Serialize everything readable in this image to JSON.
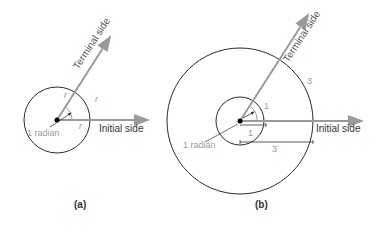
{
  "figure_a": {
    "caption": "(a)",
    "terminal_label": "Terminal side",
    "initial_label": "Initial side",
    "angle_label": "1 radian",
    "radius_labels": [
      "r",
      "r",
      "r"
    ]
  },
  "figure_b": {
    "caption": "(b)",
    "terminal_label": "Terminal side",
    "initial_label": "Initial side",
    "angle_label": "1 radian",
    "arc_small_label": "1",
    "arc_large_label": "3",
    "radius_small_label": "1",
    "radius_large_label": "3"
  },
  "colors": {
    "circle": "#2a2a2a",
    "arrow": "#9a9a9a",
    "label_gray": "#9a9a9a",
    "text_dark": "#333333"
  }
}
